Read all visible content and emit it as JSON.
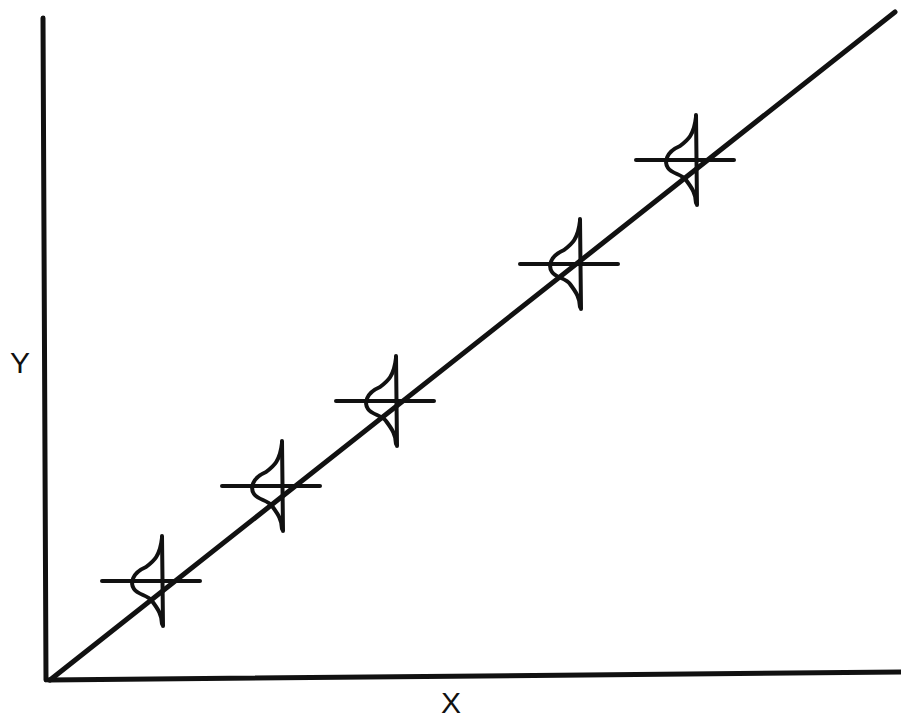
{
  "figure": {
    "type": "regression-with-conditional-distributions",
    "axes": {
      "x_label": "X",
      "y_label": "Y"
    },
    "colors": {
      "ink": "#111111",
      "background": "#ffffff"
    },
    "regression_line": {
      "from": [
        50,
        680
      ],
      "to": [
        895,
        12
      ]
    },
    "distributions": [
      {
        "id": 1,
        "cx": 152,
        "cy": 581
      },
      {
        "id": 2,
        "cx": 272,
        "cy": 486
      },
      {
        "id": 3,
        "cx": 386,
        "cy": 401
      },
      {
        "id": 4,
        "cx": 570,
        "cy": 264
      },
      {
        "id": 5,
        "cx": 686,
        "cy": 160
      }
    ]
  }
}
